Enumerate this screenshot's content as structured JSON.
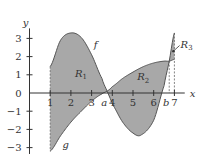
{
  "chart_data": {
    "type": "area",
    "title": "",
    "xlabel": "x",
    "ylabel": "y",
    "xlim": [
      0,
      7.6
    ],
    "ylim": [
      -3.4,
      3.6
    ],
    "x_ticks": [
      "1",
      "2",
      "3",
      "4",
      "5",
      "6",
      "7"
    ],
    "x_tick_values": [
      1,
      2,
      3,
      4,
      5,
      6,
      7
    ],
    "y_ticks": [
      "-3",
      "-2",
      "-1",
      "0",
      "1",
      "2",
      "3"
    ],
    "y_tick_values": [
      -3,
      -2,
      -1,
      0,
      1,
      2,
      3
    ],
    "special_x_labels": [
      {
        "label": "a",
        "x": 3.75
      },
      {
        "label": "b",
        "x": 6.75
      }
    ],
    "series": [
      {
        "name": "f",
        "x": [
          1,
          1.5,
          2,
          2.5,
          3,
          3.5,
          3.75,
          4,
          4.5,
          5,
          5.4,
          6,
          6.5,
          6.75,
          7
        ],
        "y": [
          1.45,
          2.9,
          3.3,
          3.05,
          2.1,
          0.8,
          0.1,
          -0.6,
          -1.6,
          -2.2,
          -2.3,
          -1.5,
          0.4,
          1.75,
          3.3
        ]
      },
      {
        "name": "g",
        "x": [
          1,
          1.5,
          2,
          2.5,
          3,
          3.5,
          3.75,
          4,
          4.5,
          5,
          5.5,
          6,
          6.5,
          6.75,
          7
        ],
        "y": [
          -3.2,
          -2.35,
          -1.6,
          -1.0,
          -0.45,
          -0.05,
          0.1,
          0.35,
          0.8,
          1.15,
          1.45,
          1.65,
          1.75,
          1.75,
          1.85
        ]
      }
    ],
    "regions": [
      {
        "label": "R",
        "sub": "1",
        "x_range": [
          1,
          3.75
        ],
        "lx": 2.2,
        "ly": 0.9
      },
      {
        "label": "R",
        "sub": "2",
        "x_range": [
          3.75,
          6.75
        ],
        "lx": 5.2,
        "ly": 0.7
      },
      {
        "label": "R",
        "sub": "3",
        "x_range": [
          6.75,
          7
        ],
        "lx": 7.3,
        "ly": 2.5
      }
    ],
    "curve_labels": [
      {
        "name": "f",
        "x": 3.1,
        "y": 2.5
      },
      {
        "name": "g",
        "x": 1.6,
        "y": -3.0
      }
    ],
    "dashed_lines_x": [
      1,
      6.75,
      7
    ],
    "grid": false,
    "legend": "none"
  }
}
